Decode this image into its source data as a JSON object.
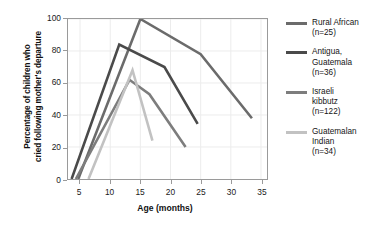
{
  "chart_data": {
    "type": "line",
    "title": "",
    "xlabel": "Age (months)",
    "ylabel": "Percentage of children who\ncried following mother's departure",
    "xlim": [
      3,
      36
    ],
    "ylim": [
      0,
      100
    ],
    "xticks": [
      5,
      10,
      15,
      20,
      25,
      30,
      35
    ],
    "yticks": [
      0,
      20,
      40,
      60,
      80,
      100
    ],
    "grid": true,
    "legend_position": "right",
    "series": [
      {
        "name": "Rural African",
        "label": "Rural African\n(n=25)",
        "n": 25,
        "color": "#6b6b6b",
        "points": [
          [
            4.7,
            0
          ],
          [
            15.0,
            100
          ],
          [
            25.0,
            78
          ],
          [
            33.5,
            38
          ]
        ]
      },
      {
        "name": "Antigua, Guatemala",
        "label": "Antigua,\nGuatemala\n(n=36)",
        "n": 36,
        "color": "#4a4a4a",
        "points": [
          [
            3.6,
            0
          ],
          [
            11.5,
            84
          ],
          [
            19.0,
            70
          ],
          [
            24.5,
            34.5
          ]
        ]
      },
      {
        "name": "Israeli kibbutz",
        "label": "Israeli\nkibbutz\n(n=122)",
        "n": 122,
        "color": "#7d7d7d",
        "points": [
          [
            4.3,
            0
          ],
          [
            13.2,
            62
          ],
          [
            16.5,
            53
          ],
          [
            22.5,
            20
          ]
        ]
      },
      {
        "name": "Guatemalan Indian",
        "label": "Guatemalan\nIndian\n(n=34)",
        "n": 34,
        "color": "#c2c2c2",
        "points": [
          [
            6.4,
            0
          ],
          [
            13.7,
            68
          ],
          [
            17.0,
            24
          ]
        ]
      }
    ]
  },
  "axes": {
    "xlabel": "Age (months)",
    "ylabel_line1": "Percentage of children who",
    "ylabel_line2": "cried following mother's departure",
    "xticklabels": [
      "5",
      "10",
      "15",
      "20",
      "25",
      "30",
      "35"
    ],
    "yticklabels": [
      "0",
      "20",
      "40",
      "60",
      "80",
      "100"
    ]
  },
  "legend": {
    "entries": [
      {
        "label": "Rural African\n(n=25)",
        "color": "#6b6b6b"
      },
      {
        "label": "Antigua,\nGuatemala\n(n=36)",
        "color": "#4a4a4a"
      },
      {
        "label": "Israeli\nkibbutz\n(n=122)",
        "color": "#7d7d7d"
      },
      {
        "label": "Guatemalan\nIndian\n(n=34)",
        "color": "#c2c2c2"
      }
    ]
  }
}
